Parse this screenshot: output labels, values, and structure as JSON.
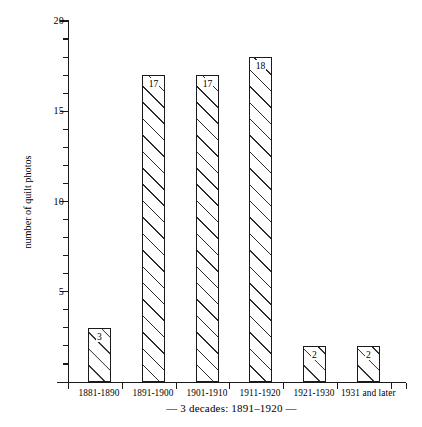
{
  "chart_data": {
    "type": "bar",
    "title": "",
    "subtitle": "",
    "xlabel": "— 3 decades: 1891–1920 —",
    "ylabel": "number of quilt photos",
    "categories": [
      "1881-1890",
      "1891-1900",
      "1901-1910",
      "1911-1920",
      "1921-1930",
      "1931 and later"
    ],
    "values": [
      3,
      17,
      17,
      18,
      2,
      2
    ],
    "data_labels": [
      "3",
      "17",
      "17",
      "18",
      "2",
      "2"
    ],
    "ylim": [
      0,
      20
    ],
    "xlim_note": "categorical",
    "y_major_ticks": [
      5,
      10,
      15,
      20
    ],
    "y_major_tick_labels": [
      "5",
      "10",
      "15",
      "20"
    ],
    "y_minor_tick_interval": 1,
    "grid": false,
    "legend": "none",
    "bar_fill": "diagonal-hatch",
    "colors": {
      "axis": "#1a1a1a",
      "bar_outline": "#1a1a1a",
      "bar_hatch": "#2b2b2b",
      "bar_background": "#ffffff",
      "page_background": "#ffffff",
      "text": "#000000"
    }
  },
  "caption": {
    "text": "— 3 decades: 1891–1920 —"
  }
}
